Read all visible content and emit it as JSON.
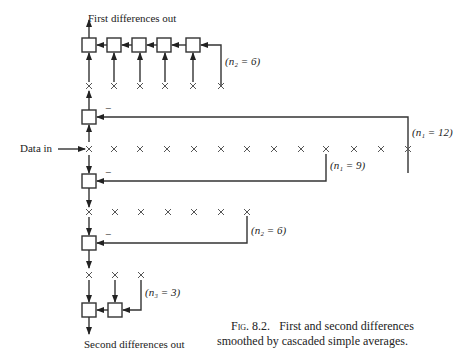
{
  "labels": {
    "first_out": "First differences out",
    "data_in": "Data in",
    "second_out": "Second differences out",
    "n2_top": "(n₂ = 6)",
    "n1_12": "(n₁ = 12)",
    "n1_9": "(n₁ = 9)",
    "n2_mid": "(n₂ = 6)",
    "n3": "(n₃ = 3)",
    "minus_1": "−",
    "minus_2": "−",
    "minus_3": "−"
  },
  "caption": {
    "fig": "Fig. 8.2.",
    "line1": "First and second differences",
    "line2": "smoothed by cascaded simple averages."
  },
  "structure": {
    "data_row_count": 13,
    "first_smoother_taps": 6,
    "second_row_count": 7,
    "third_row_count": 3
  }
}
